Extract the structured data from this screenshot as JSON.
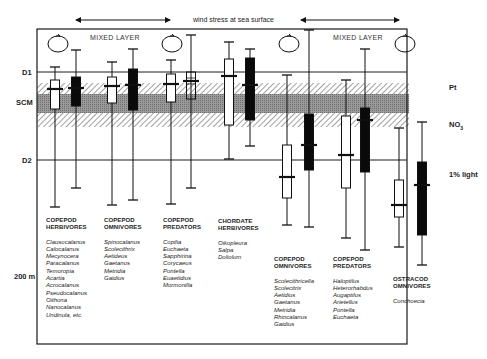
{
  "header": {
    "wind_text": "wind stress at sea surface",
    "mixed_layer_left": "MIXED LAYER",
    "mixed_layer_right": "MIXED LAYER"
  },
  "depth_labels": {
    "d1": "D1",
    "scm": "SCM",
    "d2": "D2",
    "depth_200": "200 m"
  },
  "right_labels": {
    "pt": "Pt",
    "no3": "NO3",
    "light": "1% light"
  },
  "colors": {
    "line": "#1a1a1a",
    "scm_band": "#8c8c8c",
    "hatch": "#9a9a9a",
    "box_white": "#ffffff",
    "box_black": "#0a0a0a"
  },
  "groups": [
    {
      "title1": "COPEPOD",
      "title2": "HERBIVORES",
      "species": [
        "Clausocalanus",
        "Calocalanus",
        "Mecynocera",
        "Paracalanus",
        "Temoropia",
        "Acartia",
        "Acrocalanus",
        "Pseudocalanus",
        "Oithona",
        "Nanocalanus",
        "Undinula, etc."
      ]
    },
    {
      "title1": "COPEPOD",
      "title2": "OMNIVORES",
      "species": [
        "Spinocalanus",
        "Scolecithrix",
        "Aetideus",
        "Gaetanus",
        "Metridia",
        "Gaidius"
      ]
    },
    {
      "title1": "COPEPOD",
      "title2": "PREDATORS",
      "species": [
        "Copilia",
        "Euchaeta",
        "Sapphirina",
        "Corycaeus",
        "Pontella",
        "Euaetidius",
        "Mormonilla"
      ]
    },
    {
      "title1": "CHORDATE",
      "title2": "HERBIVORES",
      "species": [
        "Oikopleura",
        "Salpa",
        "Doliolum"
      ]
    },
    {
      "title1": "COPEPOD",
      "title2": "OMNIVORES",
      "species": [
        "Scolecithricella",
        "Scolecitrix",
        "Aetidius",
        "Gaetanus",
        "Metridia",
        "Rhincalanus",
        "Gaidius"
      ]
    },
    {
      "title1": "COPEPOD",
      "title2": "PREDATORS",
      "species": [
        "Haloptilus",
        "Heterorhabdus",
        "Augaptilus",
        "Arietellus",
        "Pontella",
        "Euchaeta"
      ]
    },
    {
      "title1": "OSTRACOD",
      "title2": "OMNIVORES",
      "species": [
        "Conchoecia"
      ]
    }
  ],
  "boxplots": [
    {
      "group": 0,
      "x": 55,
      "whisker_top": 67,
      "box_top": 80,
      "box_bottom": 109,
      "whisker_bottom": 207,
      "median": 89,
      "fill": "white"
    },
    {
      "group": 0,
      "x": 76,
      "whisker_top": 50,
      "box_top": 77,
      "box_bottom": 106,
      "whisker_bottom": 188,
      "median": 88,
      "fill": "black"
    },
    {
      "group": 1,
      "x": 112,
      "whisker_top": 62,
      "box_top": 77,
      "box_bottom": 103,
      "whisker_bottom": 205,
      "median": 86,
      "fill": "white"
    },
    {
      "group": 1,
      "x": 133,
      "whisker_top": 49,
      "box_top": 69,
      "box_bottom": 110,
      "whisker_bottom": 200,
      "median": 85,
      "fill": "black"
    },
    {
      "group": 2,
      "x": 171,
      "whisker_top": 60,
      "box_top": 74,
      "box_bottom": 102,
      "whisker_bottom": 204,
      "median": 84,
      "fill": "white"
    },
    {
      "group": 2,
      "x": 191,
      "whisker_top": 35,
      "box_top": 72,
      "box_bottom": 99,
      "whisker_bottom": 188,
      "median": 81,
      "fill": "outline"
    },
    {
      "group": 3,
      "x": 229,
      "whisker_top": 42,
      "box_top": 59,
      "box_bottom": 125,
      "whisker_bottom": 159,
      "median": 76,
      "fill": "white"
    },
    {
      "group": 3,
      "x": 250,
      "whisker_top": 49,
      "box_top": 58,
      "box_bottom": 120,
      "whisker_bottom": 146,
      "median": 85,
      "fill": "black"
    },
    {
      "group": 4,
      "x": 287,
      "whisker_top": 75,
      "box_top": 145,
      "box_bottom": 198,
      "whisker_bottom": 225,
      "median": 177,
      "fill": "white"
    },
    {
      "group": 4,
      "x": 309,
      "whisker_top": 30,
      "box_top": 114,
      "box_bottom": 170,
      "whisker_bottom": 227,
      "median": 145,
      "fill": "black"
    },
    {
      "group": 5,
      "x": 346,
      "whisker_top": 80,
      "box_top": 116,
      "box_bottom": 188,
      "whisker_bottom": 238,
      "median": 155,
      "fill": "white"
    },
    {
      "group": 5,
      "x": 365,
      "whisker_top": 49,
      "box_top": 108,
      "box_bottom": 172,
      "whisker_bottom": 250,
      "median": 120,
      "fill": "black"
    },
    {
      "group": 6,
      "x": 399,
      "whisker_top": 128,
      "box_top": 180,
      "box_bottom": 217,
      "whisker_bottom": 247,
      "median": 205,
      "fill": "white"
    },
    {
      "group": 6,
      "x": 422,
      "whisker_top": 122,
      "box_top": 162,
      "box_bottom": 235,
      "whisker_bottom": 265,
      "median": 185,
      "fill": "black"
    }
  ]
}
